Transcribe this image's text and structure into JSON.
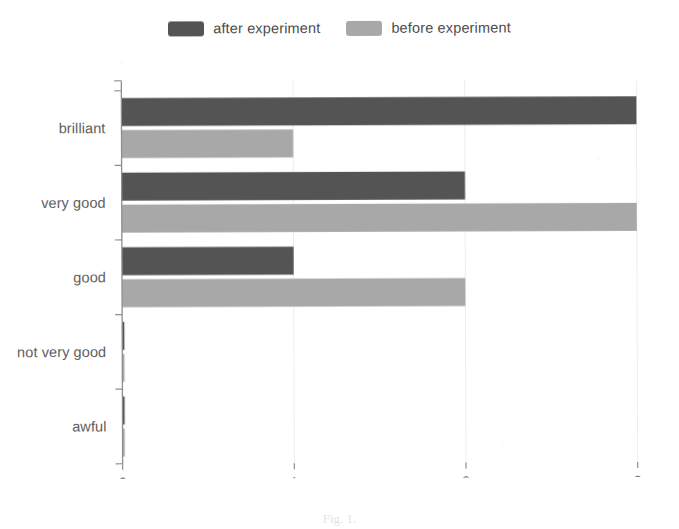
{
  "legend": {
    "position": "top-center",
    "entries": [
      {
        "label": "after experiment",
        "color": "#545454",
        "swatch_name": "legend-swatch-after"
      },
      {
        "label": "before experiment",
        "color": "#a8a8a8",
        "swatch_name": "legend-swatch-before"
      }
    ]
  },
  "axis": {
    "x_ticks": [
      "0",
      "1",
      "2",
      "3"
    ],
    "y_categories": [
      "brilliant",
      "very good",
      "good",
      "not very good",
      "awful"
    ]
  },
  "caption": {
    "text": "Fig. 1.",
    "note": "clipped at bottom edge"
  },
  "chart_data": {
    "type": "bar",
    "orientation": "horizontal",
    "title": "",
    "subtitle": "",
    "xlabel": "",
    "ylabel": "",
    "xlim": [
      0,
      3
    ],
    "xticks": [
      0,
      1,
      2,
      3
    ],
    "grid": "vertical-light",
    "legend_position": "top-center",
    "categories": [
      "brilliant",
      "very good",
      "good",
      "not very good",
      "awful"
    ],
    "series": [
      {
        "name": "after experiment",
        "color": "#545454",
        "values": [
          3,
          2,
          1,
          0,
          0
        ]
      },
      {
        "name": "before experiment",
        "color": "#a8a8a8",
        "values": [
          1,
          3,
          2,
          0,
          0
        ]
      }
    ]
  }
}
